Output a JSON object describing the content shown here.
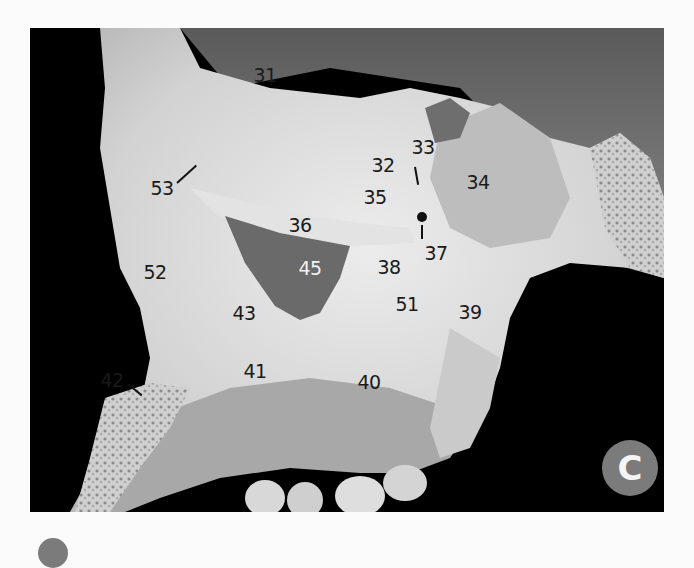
{
  "figure": {
    "panel_letter": "C",
    "labels": [
      {
        "id": "31",
        "text": "31"
      },
      {
        "id": "32",
        "text": "32"
      },
      {
        "id": "33",
        "text": "33"
      },
      {
        "id": "34",
        "text": "34"
      },
      {
        "id": "35",
        "text": "35"
      },
      {
        "id": "36",
        "text": "36"
      },
      {
        "id": "37",
        "text": "37"
      },
      {
        "id": "38",
        "text": "38"
      },
      {
        "id": "39",
        "text": "39"
      },
      {
        "id": "40",
        "text": "40"
      },
      {
        "id": "41",
        "text": "41"
      },
      {
        "id": "42",
        "text": "42"
      },
      {
        "id": "43",
        "text": "43"
      },
      {
        "id": "45",
        "text": "45"
      },
      {
        "id": "51",
        "text": "51"
      },
      {
        "id": "52",
        "text": "52"
      },
      {
        "id": "53",
        "text": "53"
      }
    ],
    "colors": {
      "background": "#000000",
      "bone": "#d9d9d9",
      "badge": "#7b7b7b",
      "label_dark": "#1a1a1a",
      "label_light": "#f2f2f2"
    }
  }
}
